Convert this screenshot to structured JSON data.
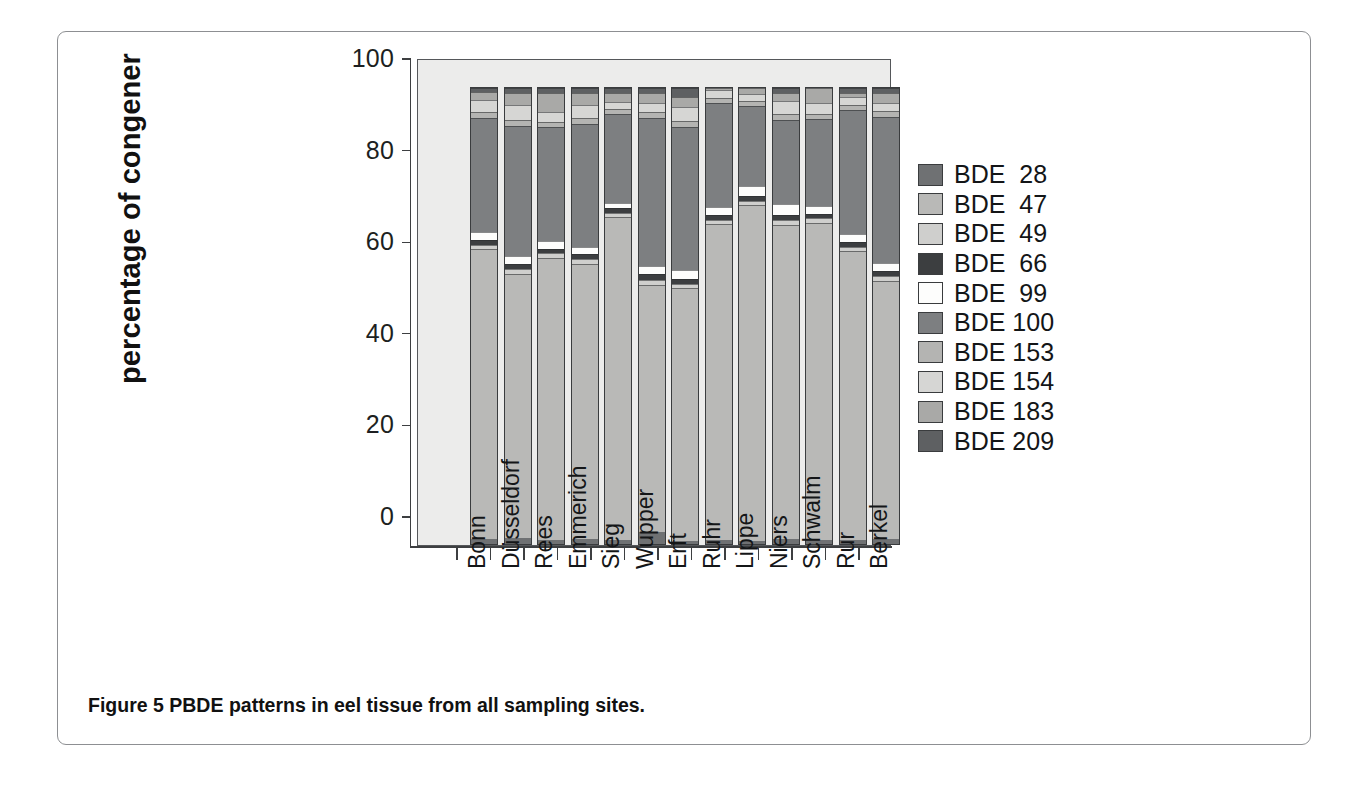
{
  "figure": {
    "caption_label": "Figure 5",
    "caption_text": "PBDE patterns in eel tissue from all sampling sites."
  },
  "chart_data": {
    "type": "bar",
    "stacked": true,
    "title": "",
    "xlabel": "",
    "ylabel": "percentage of congener",
    "ylim": [
      0,
      100
    ],
    "yticks": [
      0,
      20,
      40,
      60,
      80,
      100
    ],
    "ytick_labels": [
      "0",
      "20",
      "40",
      "60",
      "80",
      "100"
    ],
    "grid": false,
    "legend_position": "right",
    "categories": [
      "Bonn",
      "Düsseldorf",
      "Rees",
      "Emmerich",
      "Sieg",
      "Wupper",
      "Erft",
      "Ruhr",
      "Lippe",
      "Niers",
      "Schwalm",
      "Rur",
      "Berkel"
    ],
    "series": [
      {
        "name": "BDE  28",
        "color": "#6f7173",
        "values": [
          1.0,
          1.3,
          0.8,
          1.0,
          0.9,
          2.6,
          0.7,
          1.0,
          0.7,
          1.2,
          0.8,
          0.8,
          1.1
        ]
      },
      {
        "name": "BDE  47",
        "color": "#b9b9b7",
        "values": [
          63.6,
          58.0,
          62.0,
          60.4,
          70.8,
          54.3,
          55.4,
          69.8,
          73.6,
          68.8,
          69.6,
          63.4,
          56.6
        ]
      },
      {
        "name": "BDE  49",
        "color": "#cfcfcd",
        "values": [
          1.0,
          1.0,
          1.0,
          1.0,
          1.0,
          1.0,
          1.0,
          1.0,
          1.0,
          1.0,
          1.0,
          1.0,
          1.0
        ]
      },
      {
        "name": "BDE  66",
        "color": "#3c3e40",
        "values": [
          1.1,
          1.2,
          1.0,
          1.1,
          1.0,
          1.3,
          1.0,
          1.1,
          1.0,
          1.1,
          1.0,
          1.1,
          1.2
        ]
      },
      {
        "name": "BDE  99",
        "color": "#fdfdfc",
        "values": [
          1.8,
          1.7,
          1.6,
          1.7,
          1.2,
          1.8,
          2.0,
          1.7,
          2.2,
          2.4,
          1.8,
          1.6,
          1.8
        ]
      },
      {
        "name": "BDE 100",
        "color": "#7d7f81",
        "values": [
          25.0,
          28.5,
          25.0,
          27.0,
          19.5,
          32.5,
          31.4,
          23.0,
          17.5,
          18.5,
          19.0,
          27.2,
          32.0
        ]
      },
      {
        "name": "BDE 153",
        "color": "#b4b4b2",
        "values": [
          1.2,
          1.2,
          1.1,
          1.2,
          1.0,
          1.2,
          1.2,
          1.1,
          1.2,
          1.2,
          1.2,
          1.1,
          1.2
        ]
      },
      {
        "name": "BDE 154",
        "color": "#d6d6d4",
        "values": [
          2.6,
          3.4,
          2.2,
          2.8,
          1.6,
          2.1,
          3.1,
          1.9,
          1.6,
          3.0,
          2.4,
          1.8,
          1.8
        ]
      },
      {
        "name": "BDE 183",
        "color": "#a9a9a7",
        "values": [
          1.8,
          2.7,
          4.3,
          2.8,
          2.0,
          2.2,
          2.2,
          0.4,
          1.2,
          1.8,
          3.2,
          1.0,
          2.3
        ]
      },
      {
        "name": "BDE 209",
        "color": "#5e6062",
        "values": [
          0.9,
          1.0,
          1.0,
          1.0,
          1.0,
          1.0,
          2.0,
          0.0,
          0.0,
          1.0,
          0.0,
          1.0,
          1.0
        ]
      }
    ]
  },
  "legend": {
    "items": [
      {
        "label": "BDE  28",
        "color": "#6f7173"
      },
      {
        "label": "BDE  47",
        "color": "#b9b9b7"
      },
      {
        "label": "BDE  49",
        "color": "#cfcfcd"
      },
      {
        "label": "BDE  66",
        "color": "#3c3e40"
      },
      {
        "label": "BDE  99",
        "color": "#fdfdfc"
      },
      {
        "label": "BDE 100",
        "color": "#7d7f81"
      },
      {
        "label": "BDE 153",
        "color": "#b4b4b2"
      },
      {
        "label": "BDE 154",
        "color": "#d6d6d4"
      },
      {
        "label": "BDE 183",
        "color": "#a9a9a7"
      },
      {
        "label": "BDE 209",
        "color": "#5e6062"
      }
    ]
  },
  "colors": {
    "panel_background": "#ececeb",
    "axis": "#3d3f41",
    "frame": "#8d8f92",
    "page_background": "#ffffff"
  }
}
